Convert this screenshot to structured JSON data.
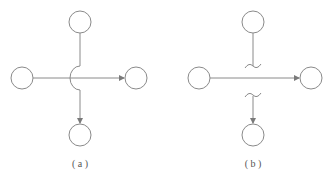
{
  "colors": {
    "stroke": "#8a8a8a",
    "arrow": "#7a7a7a",
    "background": "#ffffff"
  },
  "panels": [
    {
      "id": "a",
      "caption": "( a )",
      "nodes": [
        {
          "name": "top",
          "cx": 80,
          "cy": 22
        },
        {
          "name": "left",
          "cx": 22,
          "cy": 78
        },
        {
          "name": "right",
          "cx": 136,
          "cy": 78
        },
        {
          "name": "bottom",
          "cx": 80,
          "cy": 135
        }
      ],
      "crossing_style": "arc-hop"
    },
    {
      "id": "b",
      "caption": "( b )",
      "nodes": [
        {
          "name": "top",
          "cx": 253,
          "cy": 22
        },
        {
          "name": "left",
          "cx": 199,
          "cy": 78
        },
        {
          "name": "right",
          "cx": 311,
          "cy": 78
        },
        {
          "name": "bottom",
          "cx": 253,
          "cy": 135
        }
      ],
      "crossing_style": "break-marks"
    }
  ]
}
